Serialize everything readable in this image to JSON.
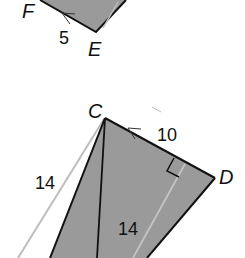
{
  "diagram": {
    "type": "geometry-figure",
    "colors": {
      "fill": "#9a9a9a",
      "stroke": "#111111",
      "highlight_line": "#bdbdbd",
      "background": "#ffffff"
    },
    "top_figure": {
      "vertices": [
        {
          "name": "F",
          "label": "F"
        },
        {
          "name": "E",
          "label": "E"
        }
      ],
      "side_labels": [
        {
          "side": "FE",
          "value": "5"
        }
      ]
    },
    "bottom_figure": {
      "vertices": [
        {
          "name": "C",
          "label": "C"
        },
        {
          "name": "D",
          "label": "D"
        }
      ],
      "side_labels": [
        {
          "side": "CD",
          "value": "10"
        },
        {
          "side": "left-slant",
          "value": "14"
        },
        {
          "side": "height",
          "value": "14"
        }
      ],
      "right_angle_mark": true
    }
  }
}
